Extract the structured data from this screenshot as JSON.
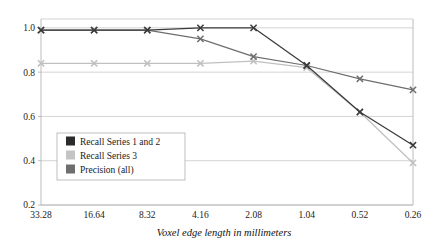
{
  "chart_data": {
    "type": "line",
    "title": "",
    "subtitle": "",
    "xlabel": "Voxel edge length in millimeters",
    "ylabel": "",
    "categories": [
      "33.28",
      "16.64",
      "8.32",
      "4.16",
      "2.08",
      "1.04",
      "0.52",
      "0.26"
    ],
    "x_tick_labels": [
      "33.28",
      "16.64",
      "8.32",
      "4.16",
      "2.08",
      "1.04",
      "0.52",
      "0.26"
    ],
    "y_tick_labels": [
      "0.2",
      "0.4",
      "0.6",
      "0.8",
      "1.0"
    ],
    "y_ticks": [
      0.2,
      0.4,
      0.6,
      0.8,
      1.0
    ],
    "ylim": [
      0.2,
      1.04
    ],
    "grid": true,
    "grid_axis": "y",
    "legend_position": "lower-left",
    "marker": "x",
    "series": [
      {
        "name": "Recall Series 1 and 2",
        "color": "#3a3a3a",
        "values": [
          0.99,
          0.99,
          0.99,
          1.0,
          1.0,
          0.83,
          0.62,
          0.47
        ]
      },
      {
        "name": "Recall Series 3",
        "color": "#c0c0c0",
        "values": [
          0.84,
          0.84,
          0.84,
          0.84,
          0.85,
          0.82,
          0.62,
          0.39
        ]
      },
      {
        "name": "Precision (all)",
        "color": "#6e6e6e",
        "values": [
          0.99,
          0.99,
          0.99,
          0.95,
          0.87,
          0.83,
          0.77,
          0.72
        ]
      }
    ]
  },
  "legend": {
    "items": [
      {
        "label": "Recall Series 1 and 2",
        "swatch": "#2b2b2b"
      },
      {
        "label": "Recall Series 3",
        "swatch": "#c4c4c4"
      },
      {
        "label": "Precision (all)",
        "swatch": "#6e6e6e"
      }
    ]
  },
  "axes": {
    "x_title": "Voxel edge length in millimeters"
  }
}
